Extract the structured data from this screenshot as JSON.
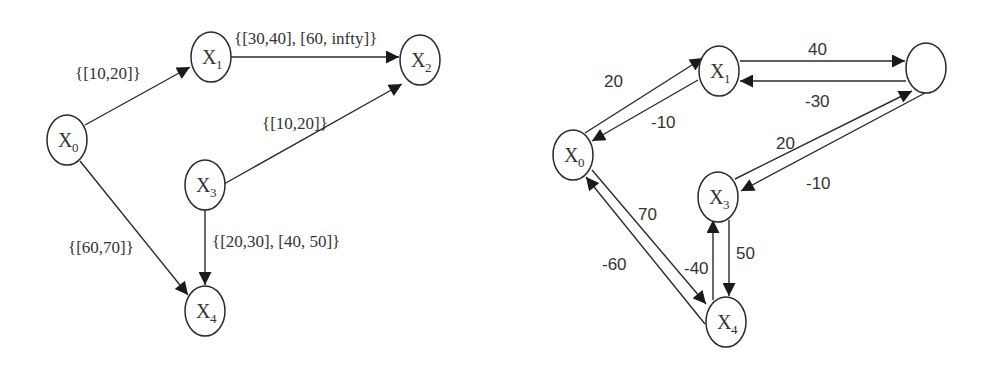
{
  "left_graph": {
    "nodes": [
      {
        "id": "X0",
        "base": "X",
        "sub": "0"
      },
      {
        "id": "X1",
        "base": "X",
        "sub": "1"
      },
      {
        "id": "X2",
        "base": "X",
        "sub": "2"
      },
      {
        "id": "X3",
        "base": "X",
        "sub": "3"
      },
      {
        "id": "X4",
        "base": "X",
        "sub": "4"
      }
    ],
    "edges": [
      {
        "from": "X0",
        "to": "X1",
        "label": "{[10,20]}"
      },
      {
        "from": "X1",
        "to": "X2",
        "label": "{[30,40], [60, infty]}"
      },
      {
        "from": "X3",
        "to": "X2",
        "label": "{[10,20]}"
      },
      {
        "from": "X0",
        "to": "X4",
        "label": "{[60,70]}"
      },
      {
        "from": "X3",
        "to": "X4",
        "label": "{[20,30], [40, 50]}"
      }
    ]
  },
  "right_graph": {
    "nodes": [
      {
        "id": "X0",
        "base": "X",
        "sub": "0"
      },
      {
        "id": "X1",
        "base": "X",
        "sub": "1"
      },
      {
        "id": "X2",
        "base": "",
        "sub": ""
      },
      {
        "id": "X3",
        "base": "X",
        "sub": "3"
      },
      {
        "id": "X4",
        "base": "X",
        "sub": "4"
      }
    ],
    "edges": [
      {
        "from": "X0",
        "to": "X1",
        "label": "20"
      },
      {
        "from": "X1",
        "to": "X0",
        "label": "-10"
      },
      {
        "from": "X1",
        "to": "X2",
        "label": "40"
      },
      {
        "from": "X2",
        "to": "X1",
        "label": "-30"
      },
      {
        "from": "X3",
        "to": "X2",
        "label": "20"
      },
      {
        "from": "X2",
        "to": "X3",
        "label": "-10"
      },
      {
        "from": "X0",
        "to": "X4",
        "label": "70"
      },
      {
        "from": "X4",
        "to": "X0",
        "label": "-60"
      },
      {
        "from": "X3",
        "to": "X4",
        "label": "50"
      },
      {
        "from": "X4",
        "to": "X3",
        "label": "-40"
      }
    ]
  }
}
